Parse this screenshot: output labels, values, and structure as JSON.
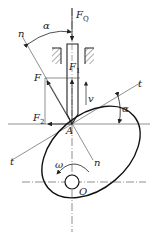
{
  "diagram": {
    "type": "cam-follower force diagram",
    "labels": {
      "FQ": {
        "main": "F",
        "sub": "Q"
      },
      "F": {
        "main": "F",
        "sub": ""
      },
      "F1": {
        "main": "F",
        "sub": "1"
      },
      "F2": {
        "main": "F",
        "sub": "2"
      },
      "v": "v",
      "alpha_top": "α",
      "alpha_right": "α",
      "n_top": "n",
      "n_bottom": "n",
      "t_right": "t",
      "t_left": "t",
      "A": "A",
      "omega": "ω",
      "O": "O"
    },
    "colors": {
      "line": "#222222",
      "thin_line": "#444444",
      "background": "#ffffff"
    }
  }
}
